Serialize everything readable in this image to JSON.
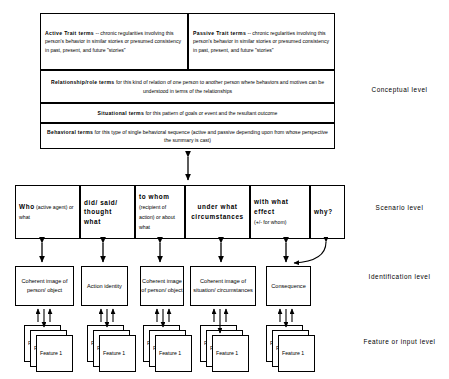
{
  "diagram": {
    "conceptual": {
      "active_trait": {
        "head": "Active Trait terms",
        "body": " -- chronic regularities involving this person's behavior in similar stories or presumed consistency in past, present, and future \"stories\""
      },
      "passive_trait": {
        "head": "Passive Trait terms",
        "body": " -- chronic regularities involving this person's behavior in similar stories or presumed consistency in past, present, and future \"stories\""
      },
      "relationship": {
        "head": "Relationship/role terms",
        "body": " for this kind of  relation of one person to another person where behaviors and motives can be understood in terms of the relationships"
      },
      "situational": {
        "head": "Situational terms",
        "body": " for this pattern of goals or event and the resultant outcome"
      },
      "behavioral": {
        "head": "Behavioral terms",
        "body": " for this type of single behavioral sequence (active and passive depending upon from whose perspective the   summary is cast)"
      }
    },
    "scenario": [
      {
        "head": "Who",
        "sub": " (active agent)  or what"
      },
      {
        "head": "did/ said/ thought what",
        "sub": ""
      },
      {
        "head": "to whom",
        "sub": " (recipient of action) or about what"
      },
      {
        "head": "under what circumstances",
        "sub": ""
      },
      {
        "head": "with what effect",
        "sub": "(+/-  for  whom)"
      },
      {
        "head": "why?",
        "sub": ""
      }
    ],
    "identification": [
      "Coherent image of  person/ object",
      "Action identity",
      "Coherent image of person/ object",
      "Coherent image of situation/ circumstances",
      "Consequence"
    ],
    "feature_label": "Feature 1",
    "feature_label_clipped": "F",
    "levels": [
      "Conceptual  level",
      "Scenario  level",
      "Identification level",
      "Feature or input level"
    ]
  },
  "colors": {
    "stroke": "#000000",
    "background": "#ffffff"
  }
}
